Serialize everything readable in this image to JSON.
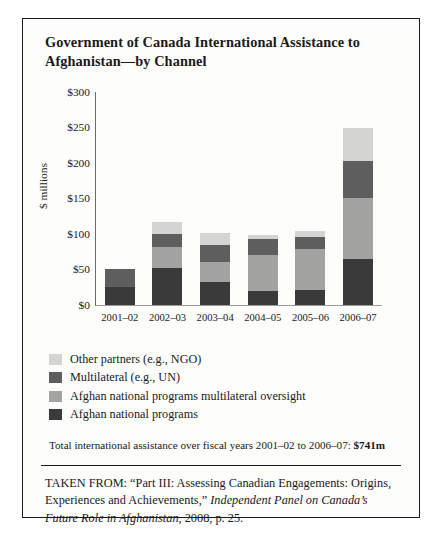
{
  "figure": {
    "title": "Government of Canada International Assistance to Afghanistan—by Channel",
    "total_note_prefix": "Total international assistance over fiscal years 2001–02 to 2006–07: ",
    "total_note_value": "$741m",
    "source_part1": "TAKEN FROM: “Part III: Assessing Canadian Engagements: Origins, Experiences and Achievements,” ",
    "source_italic": "Independent Panel on Canada’s Future Role in Afghanistan",
    "source_part2": ", 2008, p. 25."
  },
  "colors": {
    "other_partners": "#d4d4d2",
    "multilateral": "#5e5e5e",
    "anp_multilateral_oversight": "#a3a3a1",
    "afghan_national_programs": "#3a3a3a",
    "axis": "#6b6b6b",
    "border": "#1a1a1a"
  },
  "chart_data": {
    "type": "bar",
    "stacked": true,
    "title": "Government of Canada International Assistance to Afghanistan—by Channel",
    "xlabel": "",
    "ylabel": "$ millions",
    "ylim": [
      0,
      300
    ],
    "yticks": [
      "$0",
      "$50",
      "$100",
      "$150",
      "$200",
      "$250",
      "$300"
    ],
    "ytick_values": [
      0,
      50,
      100,
      150,
      200,
      250,
      300
    ],
    "grid": false,
    "legend_position": "below-plot",
    "categories": [
      "2001–02",
      "2002–03",
      "2003–04",
      "2004–05",
      "2005–06",
      "2006–07"
    ],
    "series": [
      {
        "name": "Other partners (e.g., NGO)",
        "color": "#d4d4d2",
        "values": [
          0,
          17,
          17,
          5,
          9,
          46
        ]
      },
      {
        "name": "Multilateral (e.g., UN)",
        "color": "#5e5e5e",
        "values": [
          25,
          18,
          24,
          23,
          16,
          52
        ]
      },
      {
        "name": "Afghan national programs multilateral oversight",
        "color": "#a3a3a1",
        "values": [
          0,
          30,
          28,
          51,
          58,
          87
        ]
      },
      {
        "name": "Afghan national programs",
        "color": "#3a3a3a",
        "values": [
          25,
          52,
          32,
          19,
          21,
          64
        ]
      }
    ],
    "totals": [
      50,
      117,
      101,
      98,
      104,
      249
    ],
    "grand_total": "$741m"
  }
}
